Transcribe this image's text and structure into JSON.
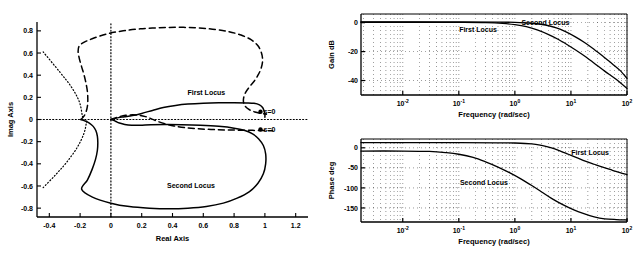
{
  "figure": {
    "background": "#ffffff",
    "ink_color": "#000000"
  },
  "chart_data": [
    {
      "id": "root-locus",
      "type": "line",
      "title": "",
      "xlabel": "Real Axis",
      "ylabel": "Imag Axis",
      "xlim": [
        -0.48,
        1.28
      ],
      "ylim": [
        -0.88,
        0.88
      ],
      "xticks": [
        "-0.4",
        "-0.2",
        "0",
        "0.2",
        "0.4",
        "0.6",
        "0.8",
        "1",
        "1.2"
      ],
      "xtick_values": [
        -0.4,
        -0.2,
        0,
        0.2,
        0.4,
        0.6,
        0.8,
        1.0,
        1.2
      ],
      "yticks": [
        "0.8",
        "0.6",
        "0.4",
        "0.2",
        "0",
        "-0.2",
        "-0.4",
        "-0.6",
        "-0.8"
      ],
      "ytick_values": [
        0.8,
        0.6,
        0.4,
        0.2,
        0,
        -0.2,
        -0.4,
        -0.6,
        -0.8
      ],
      "grid": false,
      "legend_position": "inline-annotations",
      "annotations": [
        {
          "text": "First Locus",
          "x": 0.62,
          "y": 0.22,
          "style": "solid-curve-label"
        },
        {
          "text": "Second Locus",
          "x": 0.52,
          "y": -0.62,
          "style": "solid-curve-label"
        },
        {
          "text": "s=0",
          "x": 1.03,
          "y": 0.05,
          "style": "endpoint-label"
        },
        {
          "text": "s=0",
          "x": 1.03,
          "y": -0.11,
          "style": "endpoint-label"
        }
      ],
      "series": [
        {
          "name": "First Locus",
          "style": "solid",
          "points": [
            [
              -0.195,
              0.0
            ],
            [
              -0.17,
              -0.012
            ],
            [
              -0.14,
              -0.032
            ],
            [
              -0.115,
              -0.062
            ],
            [
              -0.098,
              -0.1
            ],
            [
              -0.088,
              -0.15
            ],
            [
              -0.085,
              -0.21
            ],
            [
              -0.088,
              -0.28
            ],
            [
              -0.1,
              -0.36
            ],
            [
              -0.122,
              -0.45
            ],
            [
              -0.152,
              -0.545
            ],
            [
              -0.19,
              -0.63
            ],
            [
              -0.12,
              -0.7
            ],
            [
              0.0,
              -0.755
            ],
            [
              0.12,
              -0.786
            ],
            [
              0.25,
              -0.8
            ],
            [
              0.38,
              -0.805
            ],
            [
              0.5,
              -0.8
            ],
            [
              0.62,
              -0.785
            ],
            [
              0.73,
              -0.755
            ],
            [
              0.82,
              -0.71
            ],
            [
              0.9,
              -0.65
            ],
            [
              0.955,
              -0.575
            ],
            [
              0.99,
              -0.49
            ],
            [
              1.005,
              -0.4
            ],
            [
              1.005,
              -0.31
            ],
            [
              0.99,
              -0.235
            ],
            [
              0.96,
              -0.175
            ],
            [
              0.92,
              -0.13
            ],
            [
              0.87,
              -0.1
            ],
            [
              0.8,
              -0.078
            ],
            [
              0.7,
              -0.062
            ],
            [
              0.58,
              -0.052
            ],
            [
              0.46,
              -0.047
            ],
            [
              0.35,
              -0.046
            ],
            [
              0.26,
              -0.048
            ],
            [
              0.19,
              -0.052
            ],
            [
              0.135,
              -0.052
            ],
            [
              0.09,
              -0.045
            ],
            [
              0.055,
              -0.032
            ],
            [
              0.03,
              -0.016
            ],
            [
              0.012,
              -0.005
            ],
            [
              0.0,
              0.0
            ]
          ]
        },
        {
          "name": "First Locus upper branch",
          "style": "solid",
          "points": [
            [
              0.0,
              0.0
            ],
            [
              0.02,
              0.008
            ],
            [
              0.05,
              0.017
            ],
            [
              0.09,
              0.025
            ],
            [
              0.14,
              0.036
            ],
            [
              0.2,
              0.055
            ],
            [
              0.27,
              0.082
            ],
            [
              0.34,
              0.108
            ],
            [
              0.42,
              0.127
            ],
            [
              0.5,
              0.139
            ],
            [
              0.6,
              0.147
            ],
            [
              0.7,
              0.151
            ],
            [
              0.8,
              0.152
            ],
            [
              0.88,
              0.15
            ],
            [
              0.93,
              0.146
            ],
            [
              0.965,
              0.132
            ],
            [
              0.985,
              0.108
            ],
            [
              0.995,
              0.075
            ],
            [
              1.0,
              0.045
            ],
            [
              1.0,
              0.02
            ]
          ]
        },
        {
          "name": "Second Locus",
          "style": "dashed",
          "points": [
            [
              -0.195,
              0.0
            ],
            [
              -0.175,
              0.03
            ],
            [
              -0.16,
              0.075
            ],
            [
              -0.152,
              0.125
            ],
            [
              -0.15,
              0.18
            ],
            [
              -0.152,
              0.245
            ],
            [
              -0.16,
              0.315
            ],
            [
              -0.173,
              0.395
            ],
            [
              -0.19,
              0.475
            ],
            [
              -0.205,
              0.55
            ],
            [
              -0.213,
              0.615
            ],
            [
              -0.205,
              0.665
            ],
            [
              -0.17,
              0.7
            ],
            [
              -0.11,
              0.735
            ],
            [
              -0.02,
              0.775
            ],
            [
              0.08,
              0.8
            ],
            [
              0.19,
              0.818
            ],
            [
              0.31,
              0.828
            ],
            [
              0.43,
              0.832
            ],
            [
              0.55,
              0.828
            ],
            [
              0.66,
              0.815
            ],
            [
              0.76,
              0.795
            ],
            [
              0.845,
              0.762
            ],
            [
              0.91,
              0.72
            ],
            [
              0.955,
              0.665
            ],
            [
              0.978,
              0.6
            ],
            [
              0.985,
              0.53
            ],
            [
              0.975,
              0.46
            ],
            [
              0.955,
              0.4
            ],
            [
              0.93,
              0.345
            ],
            [
              0.9,
              0.295
            ],
            [
              0.875,
              0.245
            ],
            [
              0.862,
              0.195
            ],
            [
              0.862,
              0.15
            ],
            [
              0.875,
              0.115
            ],
            [
              0.9,
              0.088
            ],
            [
              0.935,
              0.068
            ],
            [
              0.975,
              0.055
            ],
            [
              1.01,
              0.048
            ]
          ]
        },
        {
          "name": "Second Locus lower branch",
          "style": "dashed",
          "points": [
            [
              0.0,
              0.0
            ],
            [
              0.025,
              0.012
            ],
            [
              0.055,
              0.026
            ],
            [
              0.095,
              0.038
            ],
            [
              0.14,
              0.042
            ],
            [
              0.185,
              0.038
            ],
            [
              0.225,
              0.026
            ],
            [
              0.26,
              0.008
            ],
            [
              0.3,
              -0.015
            ],
            [
              0.35,
              -0.038
            ],
            [
              0.41,
              -0.058
            ],
            [
              0.48,
              -0.073
            ],
            [
              0.56,
              -0.083
            ],
            [
              0.65,
              -0.09
            ],
            [
              0.74,
              -0.094
            ],
            [
              0.83,
              -0.096
            ],
            [
              0.92,
              -0.098
            ],
            [
              1.0,
              -0.1
            ],
            [
              1.05,
              -0.102
            ]
          ]
        },
        {
          "name": "asymptote upper",
          "style": "dotted",
          "points": [
            [
              -0.44,
              0.61
            ],
            [
              -0.33,
              0.425
            ],
            [
              -0.255,
              0.29
            ],
            [
              -0.205,
              0.16
            ],
            [
              -0.185,
              0.03
            ],
            [
              -0.18,
              0.0
            ]
          ]
        },
        {
          "name": "asymptote lower",
          "style": "dotted",
          "points": [
            [
              -0.44,
              -0.615
            ],
            [
              -0.36,
              -0.5
            ],
            [
              -0.29,
              -0.39
            ],
            [
              -0.22,
              -0.255
            ],
            [
              -0.175,
              -0.125
            ],
            [
              -0.158,
              -0.02
            ],
            [
              -0.155,
              0.0
            ]
          ]
        },
        {
          "name": "real-axis guide",
          "style": "dotted-axis",
          "points": [
            [
              -0.48,
              0.0
            ],
            [
              1.28,
              0.0
            ]
          ]
        },
        {
          "name": "imag-axis guide",
          "style": "dotted-axis",
          "points": [
            [
              0.0,
              -0.88
            ],
            [
              0.0,
              0.88
            ]
          ]
        }
      ]
    },
    {
      "id": "gain-bode",
      "type": "line",
      "title": "",
      "xlabel": "Frequency (rad/sec)",
      "ylabel": "Gain dB",
      "xscale": "log",
      "xlim": [
        0.0018,
        100
      ],
      "ylim": [
        -50,
        6
      ],
      "xticks": [
        "10",
        "10",
        "10",
        "10",
        "10"
      ],
      "xtick_exponents": [
        "-2",
        "-1",
        "0",
        "1",
        "2"
      ],
      "xtick_values": [
        0.01,
        0.1,
        1,
        10,
        100
      ],
      "yticks": [
        "0",
        "-20",
        "-40"
      ],
      "ytick_values": [
        0,
        -20,
        -40
      ],
      "grid": true,
      "legend_position": "inline-annotations",
      "annotations": [
        {
          "text": "First Locus",
          "x": 0.22,
          "y": -6.5,
          "style": "curve-label"
        },
        {
          "text": "Second Locus",
          "x": 3.5,
          "y": -1.5,
          "style": "curve-label"
        }
      ],
      "series": [
        {
          "name": "First Locus",
          "style": "solid",
          "points": [
            [
              0.0018,
              0.3
            ],
            [
              0.01,
              0.3
            ],
            [
              0.05,
              0.25
            ],
            [
              0.1,
              0.2
            ],
            [
              0.3,
              0.0
            ],
            [
              0.6,
              -0.5
            ],
            [
              1.0,
              -1.4
            ],
            [
              1.6,
              -2.8
            ],
            [
              2.5,
              -5.0
            ],
            [
              4.0,
              -8.2
            ],
            [
              6.0,
              -11.6
            ],
            [
              10,
              -16.8
            ],
            [
              16,
              -22.0
            ],
            [
              25,
              -27.5
            ],
            [
              40,
              -33.5
            ],
            [
              63,
              -39.0
            ],
            [
              100,
              -45.5
            ]
          ]
        },
        {
          "name": "Second Locus",
          "style": "solid",
          "points": [
            [
              0.0018,
              0.5
            ],
            [
              0.01,
              0.5
            ],
            [
              0.1,
              0.5
            ],
            [
              0.5,
              0.4
            ],
            [
              1.0,
              0.2
            ],
            [
              2.0,
              -0.4
            ],
            [
              3.5,
              -1.6
            ],
            [
              5.5,
              -3.6
            ],
            [
              8.0,
              -6.2
            ],
            [
              12,
              -9.8
            ],
            [
              18,
              -14.0
            ],
            [
              26,
              -18.5
            ],
            [
              38,
              -23.5
            ],
            [
              55,
              -28.5
            ],
            [
              75,
              -33.0
            ],
            [
              100,
              -38.5
            ]
          ]
        }
      ]
    },
    {
      "id": "phase-bode",
      "type": "line",
      "title": "",
      "xlabel": "Frequency (rad/sec)",
      "ylabel": "Phase deg",
      "xscale": "log",
      "xlim": [
        0.0018,
        100
      ],
      "ylim": [
        -185,
        22
      ],
      "xticks": [
        "10",
        "10",
        "10",
        "10",
        "10"
      ],
      "xtick_exponents": [
        "-2",
        "-1",
        "0",
        "1",
        "2"
      ],
      "xtick_values": [
        0.01,
        0.1,
        1,
        10,
        100
      ],
      "yticks": [
        "0",
        "-50",
        "-100",
        "-150"
      ],
      "ytick_values": [
        0,
        -50,
        -100,
        -150
      ],
      "grid": true,
      "legend_position": "inline-annotations",
      "annotations": [
        {
          "text": "First Locus",
          "x": 22,
          "y": -18,
          "style": "curve-label"
        },
        {
          "text": "Second Locus",
          "x": 0.28,
          "y": -92,
          "style": "curve-label"
        }
      ],
      "series": [
        {
          "name": "First Locus",
          "style": "solid",
          "points": [
            [
              0.0018,
              13
            ],
            [
              0.01,
              13
            ],
            [
              0.1,
              13
            ],
            [
              0.5,
              12.5
            ],
            [
              1.0,
              12
            ],
            [
              2.0,
              10
            ],
            [
              3.0,
              6
            ],
            [
              4.5,
              0
            ],
            [
              6.5,
              -8
            ],
            [
              9,
              -16
            ],
            [
              13,
              -25
            ],
            [
              18,
              -33
            ],
            [
              26,
              -41
            ],
            [
              38,
              -49
            ],
            [
              55,
              -56
            ],
            [
              75,
              -62
            ],
            [
              100,
              -67
            ]
          ]
        },
        {
          "name": "Second Locus",
          "style": "solid",
          "points": [
            [
              0.0018,
              -8
            ],
            [
              0.01,
              -8
            ],
            [
              0.03,
              -9
            ],
            [
              0.06,
              -12
            ],
            [
              0.1,
              -16
            ],
            [
              0.18,
              -24
            ],
            [
              0.3,
              -35
            ],
            [
              0.5,
              -48
            ],
            [
              0.8,
              -62
            ],
            [
              1.3,
              -78
            ],
            [
              2.0,
              -94
            ],
            [
              3.0,
              -110
            ],
            [
              4.5,
              -126
            ],
            [
              7,
              -141
            ],
            [
              11,
              -154
            ],
            [
              17,
              -164
            ],
            [
              26,
              -172
            ],
            [
              40,
              -177
            ],
            [
              65,
              -179
            ],
            [
              100,
              -180
            ]
          ]
        }
      ]
    }
  ]
}
